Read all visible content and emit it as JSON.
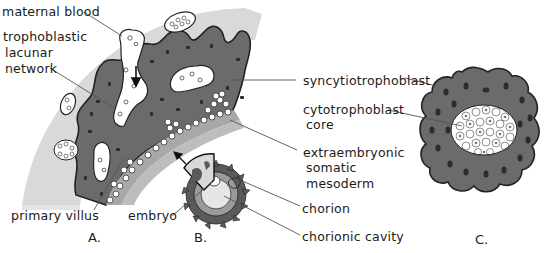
{
  "figure": {
    "panels": [
      {
        "id": "A",
        "label": "A."
      },
      {
        "id": "B",
        "label": "B."
      },
      {
        "id": "C",
        "label": "C."
      }
    ],
    "labels": {
      "maternal_blood": "maternal blood",
      "trophoblastic_lacunar_network": [
        "trophoblastic",
        "lacunar",
        "network"
      ],
      "primary_villus": "primary villus",
      "embryo": "embryo",
      "syncytiotrophoblast": "syncytiotrophoblast",
      "cytotrophoblast_core": [
        "cytotrophoblast",
        "core"
      ],
      "extraembryonic_somatic_mesoderm": [
        "extraembryonic",
        "somatic",
        "mesoderm"
      ],
      "chorion": "chorion",
      "chorionic_cavity": "chorionic cavity"
    },
    "colors": {
      "background": "#ffffff",
      "endometrium_band": "#d9d9d9",
      "syncytiotrophoblast": "#6b6b6b",
      "nuclei": "#2b2b2b",
      "lacunae": "#ffffff",
      "outline": "#222222",
      "leader_line": "#555555",
      "text": "#1a1a1a"
    }
  }
}
